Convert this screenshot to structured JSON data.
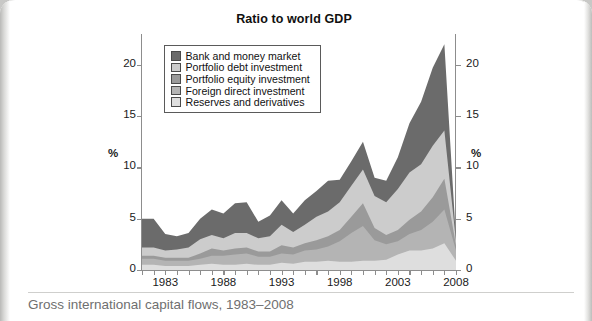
{
  "figure": {
    "title": "Ratio to world GDP",
    "ylabel_left": "%",
    "ylabel_right": "%"
  },
  "caption": "Gross international capital flows, 1983–2008",
  "legend": {
    "items": [
      {
        "label": "Bank and money market",
        "color": "#6b6b6b"
      },
      {
        "label": "Portfolio debt investment",
        "color": "#cccccc"
      },
      {
        "label": "Portfolio equity investment",
        "color": "#9a9a9a"
      },
      {
        "label": "Foreign direct investment",
        "color": "#b4b4b4"
      },
      {
        "label": "Reserves and derivatives",
        "color": "#dedede"
      }
    ]
  },
  "chart_data": {
    "type": "area",
    "stacked": true,
    "title": "Ratio to world GDP",
    "xlabel": "",
    "ylabel": "%",
    "ylim": [
      0,
      23
    ],
    "xlim": [
      1981,
      2008
    ],
    "yticks": [
      0,
      5,
      10,
      15,
      20
    ],
    "xticks_major": [
      1983,
      1988,
      1993,
      1998,
      2003,
      2008
    ],
    "xticks_minor_step": 1,
    "grid": false,
    "legend_position": "upper-left-inside",
    "dual_axis": true,
    "x": [
      1981,
      1982,
      1983,
      1984,
      1985,
      1986,
      1987,
      1988,
      1989,
      1990,
      1991,
      1992,
      1993,
      1994,
      1995,
      1996,
      1997,
      1998,
      1999,
      2000,
      2001,
      2002,
      2003,
      2004,
      2005,
      2006,
      2007,
      2008
    ],
    "series": [
      {
        "name": "Reserves and derivatives",
        "stack_order": 1,
        "color": "#dedede",
        "values": [
          0.5,
          0.5,
          0.4,
          0.4,
          0.4,
          0.5,
          0.6,
          0.5,
          0.5,
          0.6,
          0.5,
          0.5,
          0.7,
          0.6,
          0.8,
          0.8,
          0.9,
          0.8,
          0.8,
          0.9,
          0.9,
          1.0,
          1.5,
          1.9,
          1.9,
          2.1,
          2.6,
          0.9
        ]
      },
      {
        "name": "Foreign direct investment",
        "stack_order": 2,
        "color": "#b4b4b4",
        "values": [
          0.6,
          0.6,
          0.5,
          0.5,
          0.5,
          0.6,
          0.8,
          0.9,
          1.0,
          1.0,
          0.8,
          0.8,
          0.9,
          0.9,
          1.1,
          1.2,
          1.4,
          2.0,
          2.8,
          3.4,
          2.0,
          1.5,
          1.3,
          1.6,
          2.0,
          2.6,
          3.3,
          1.0
        ]
      },
      {
        "name": "Portfolio equity investment",
        "stack_order": 3,
        "color": "#9a9a9a",
        "values": [
          0.3,
          0.3,
          0.3,
          0.3,
          0.3,
          0.5,
          0.7,
          0.5,
          0.6,
          0.6,
          0.5,
          0.5,
          0.8,
          0.7,
          0.7,
          0.9,
          1.0,
          1.1,
          1.6,
          2.2,
          1.2,
          0.9,
          1.1,
          1.4,
          1.8,
          2.4,
          3.0,
          0.5
        ]
      },
      {
        "name": "Portfolio debt investment",
        "stack_order": 4,
        "color": "#cccccc",
        "values": [
          0.8,
          0.8,
          0.7,
          0.8,
          1.0,
          1.4,
          1.3,
          1.2,
          1.5,
          1.4,
          1.3,
          1.5,
          2.0,
          1.5,
          1.8,
          2.3,
          2.4,
          2.7,
          3.0,
          3.3,
          3.1,
          3.2,
          4.0,
          4.6,
          4.6,
          5.0,
          4.7,
          0.4
        ]
      },
      {
        "name": "Bank and money market",
        "stack_order": 5,
        "color": "#6b6b6b",
        "values": [
          2.8,
          2.8,
          1.6,
          1.3,
          1.4,
          2.0,
          2.5,
          2.4,
          2.9,
          3.0,
          1.6,
          2.0,
          2.4,
          1.8,
          2.4,
          2.5,
          3.0,
          2.2,
          2.4,
          2.7,
          1.8,
          2.1,
          3.1,
          4.8,
          6.1,
          7.6,
          8.4,
          0.2
        ]
      }
    ],
    "totals": [
      5.0,
      5.0,
      3.5,
      3.3,
      3.6,
      5.0,
      5.9,
      5.5,
      6.5,
      6.6,
      4.7,
      5.3,
      6.8,
      5.5,
      6.8,
      7.7,
      8.7,
      8.8,
      10.6,
      12.5,
      9.0,
      8.7,
      11.0,
      14.3,
      16.4,
      19.7,
      22.0,
      3.0
    ],
    "notes": {
      "peak_year": 2007,
      "peak_value": 22.0,
      "collapse_year": 2008,
      "collapse_value": 3.0
    }
  }
}
